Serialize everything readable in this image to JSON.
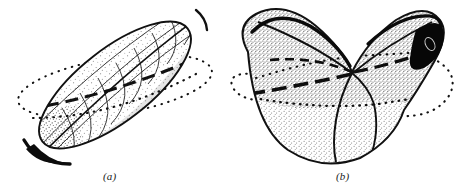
{
  "figure": {
    "domain": "Diagram",
    "background_color": "#ffffff",
    "ink_color": "#111111",
    "stipple_color": "#5a5a5a",
    "shade_fill": "#efefef",
    "dark_fill": "#000000",
    "panels": [
      {
        "id": "a",
        "caption": "(a)",
        "name": "prolate-ellipsoid-with-grid",
        "description": "Elongated ellipsoid tilted from lower-left to upper-right, ruled with meridian and parallel curves, stippled shading, dotted equatorial ellipse passing behind, heavy dashed equator segment across the front, dark thickened rim at the lower-left tip.",
        "tilt_degrees": -38,
        "features": [
          "outline",
          "meridian-curves",
          "parallel-curves",
          "stipple-shading",
          "dotted-equator-ellipse",
          "dashed-equator-chord",
          "dark-lower-tip"
        ]
      },
      {
        "id": "b",
        "caption": "(b)",
        "name": "saddle-butterfly-surface",
        "description": "Butterfly or saddle shaped surface with two upswept lobes meeting at a central crossing point above a rounded bowl; uniform fine stipple fill, dotted ellipse arcs at left and right, heavy dashed line crossing the saddle point, solid black cusp at the upper-right tip.",
        "features": [
          "outline",
          "left-lobe",
          "right-lobe",
          "central-saddle-point",
          "vertical-fold-curve",
          "stipple-shading",
          "dotted-equator-ellipse",
          "dashed-axis-line",
          "black-cusp-tip"
        ]
      }
    ]
  }
}
